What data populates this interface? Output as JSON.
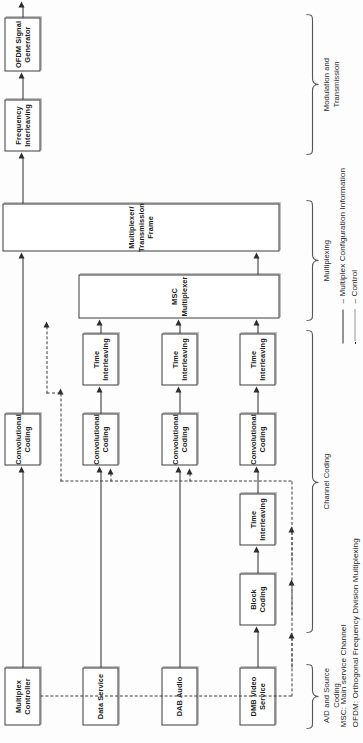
{
  "figure": {
    "orientation": "rotated-90-ccw"
  },
  "blocks": {
    "multiplex_controller": "Multiplex\nController",
    "data_service": "Data Service",
    "dab_audio": "DAB Audio",
    "dmb_video_service": "DMB Video\nService",
    "block_coding": "Block\nCoding",
    "time_interleaving_video_1": "Time\nInterleaving",
    "conv_coding_mc": "Convolutional\nCoding",
    "conv_coding_data": "Convolutional\nCoding",
    "conv_coding_audio": "Convolutional\nCoding",
    "conv_coding_video": "Convolutional\nCoding",
    "time_interleaving_data": "Time\nInterleaving",
    "time_interleaving_audio": "Time\nInterleaving",
    "time_interleaving_video_2": "Time\nInterleaving",
    "msc_multiplexer": "MSC\nMultiplexer",
    "multiplexer_transmission_frame": "Multiplexer/\nTransmission\nFrame",
    "frequency_interleaving": "Frequency\nInterleaving",
    "ofdm_signal_generator": "OFDM Signal\nGenerator"
  },
  "groups": {
    "source_coding": "A/D and Source\nCoding",
    "channel_coding": "Channel Coding",
    "multiplexing": "Multiplexing",
    "modulation": "Modulation and\nTransmission"
  },
  "legend": {
    "solid_label": "– Multiplex Configuration Information",
    "dotted_label": "– Control",
    "abbrev_msc": "MSC: Main service Channel",
    "abbrev_ofdm": "OFDM: Orthogonal Frequency Division Multiplexing"
  },
  "colors": {
    "background": "#fdfdfd",
    "block_border": "#3a3a3a",
    "block_fill": "#ffffff",
    "line": "#2d2d2d",
    "text": "#1a1a1a"
  }
}
